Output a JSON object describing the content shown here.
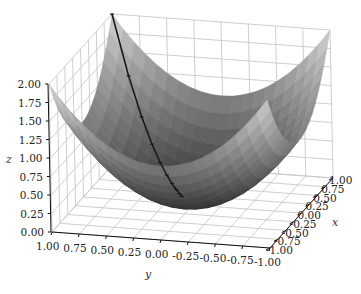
{
  "chart_data": {
    "type": "surface3d",
    "title": "",
    "function": "z = x^2 + y^2",
    "xlabel": "x",
    "ylabel": "y",
    "zlabel": "z",
    "xlim": [
      -1,
      1
    ],
    "ylim": [
      -1,
      1
    ],
    "zlim": [
      0,
      2
    ],
    "x_ticks": [
      "-1.00",
      "-0.75",
      "-0.50",
      "-0.25",
      "0.00",
      "0.25",
      "0.50",
      "0.75",
      "1.00"
    ],
    "y_ticks": [
      "1.00",
      "0.75",
      "0.50",
      "0.25",
      "0.00",
      "-0.25",
      "-0.50",
      "-0.75",
      "-1.00"
    ],
    "z_ticks": [
      "0.00",
      "0.25",
      "0.50",
      "0.75",
      "1.00",
      "1.25",
      "1.50",
      "1.75",
      "2.00"
    ],
    "x_tick_values": [
      -1,
      -0.75,
      -0.5,
      -0.25,
      0,
      0.25,
      0.5,
      0.75,
      1
    ],
    "y_tick_values": [
      1,
      0.75,
      0.5,
      0.25,
      0,
      -0.25,
      -0.5,
      -0.75,
      -1
    ],
    "z_tick_values": [
      0,
      0.25,
      0.5,
      0.75,
      1,
      1.25,
      1.5,
      1.75,
      2
    ],
    "grid": true,
    "colormap": "gray",
    "surface_resolution": 20,
    "path": {
      "name": "descent-path",
      "color": "#1a1a1a",
      "points": [
        {
          "x": 1.0,
          "y": 1.0,
          "z": 2.0
        },
        {
          "x": 0.8,
          "y": 0.8,
          "z": 1.28
        },
        {
          "x": 0.64,
          "y": 0.64,
          "z": 0.8192
        },
        {
          "x": 0.512,
          "y": 0.512,
          "z": 0.5243
        },
        {
          "x": 0.41,
          "y": 0.41,
          "z": 0.3355
        },
        {
          "x": 0.328,
          "y": 0.328,
          "z": 0.2147
        },
        {
          "x": 0.262,
          "y": 0.262,
          "z": 0.1374
        },
        {
          "x": 0.21,
          "y": 0.21,
          "z": 0.088
        },
        {
          "x": 0.168,
          "y": 0.168,
          "z": 0.0563
        },
        {
          "x": 0.134,
          "y": 0.134,
          "z": 0.036
        }
      ]
    }
  }
}
